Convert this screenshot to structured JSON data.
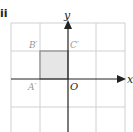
{
  "part_label": "ii",
  "axes": {
    "x_label": "x",
    "y_label": "y",
    "origin_label": "O"
  },
  "points": {
    "A": {
      "label": "A′",
      "coord": [
        -1,
        0
      ]
    },
    "B": {
      "label": "B′",
      "coord": [
        -1,
        1
      ]
    },
    "C": {
      "label": "C′",
      "coord": [
        0,
        1
      ]
    }
  },
  "grid": {
    "x_range": [
      -2,
      2
    ],
    "y_range": [
      -2,
      2
    ],
    "cell_px": 28
  },
  "colors": {
    "grid": "#d0d0d0",
    "axis": "#222222",
    "square_fill": "#e6e6e6",
    "square_stroke": "#888888",
    "point_label": "#999999"
  }
}
